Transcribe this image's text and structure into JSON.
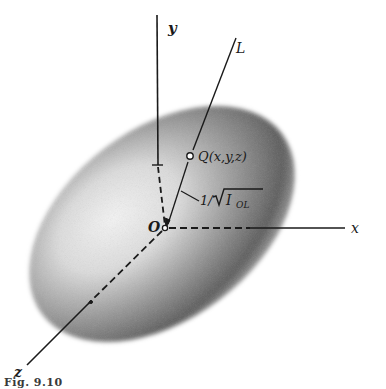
{
  "figure": {
    "caption": "Fig. 9.10",
    "colors": {
      "ink": "#1a1a1a",
      "shade_dark": "#3c3c3c",
      "shade_light": "#f2f2f2",
      "background": "#ffffff"
    },
    "labels": {
      "y_axis": "y",
      "x_axis": "x",
      "z_axis": "z",
      "line": "L",
      "origin": "O",
      "point": "Q(x,y,z)",
      "distance_prefix": "1/",
      "distance_var": "I",
      "distance_sub": "OL"
    },
    "geometry": {
      "origin": [
        165,
        228
      ],
      "ellipsoid": {
        "cx": 162,
        "cy": 224,
        "rx": 150,
        "ry": 95,
        "rotation_deg": -37
      },
      "y_axis": {
        "top": [
          157,
          15
        ],
        "tick_y": 165
      },
      "x_axis": {
        "end": [
          345,
          228
        ]
      },
      "z_axis": {
        "end": [
          27,
          365
        ]
      },
      "line_L": {
        "end": [
          236,
          38
        ]
      },
      "point_Q": [
        190,
        156
      ]
    }
  }
}
